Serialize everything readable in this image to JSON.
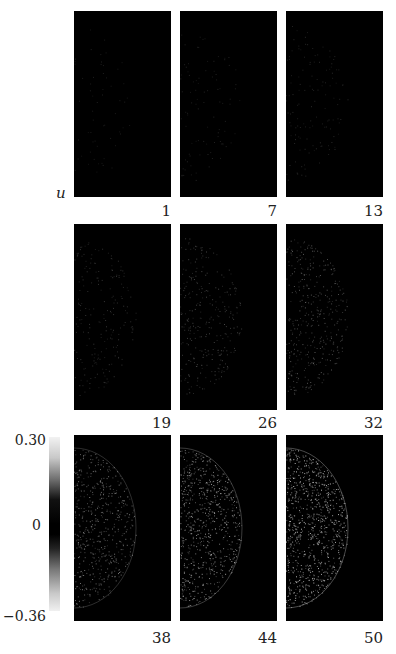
{
  "figure": {
    "row_label": "u",
    "frames": [
      {
        "label": "1",
        "intensity": 0.02
      },
      {
        "label": "7",
        "intensity": 0.06
      },
      {
        "label": "13",
        "intensity": 0.1
      },
      {
        "label": "19",
        "intensity": 0.18
      },
      {
        "label": "26",
        "intensity": 0.28
      },
      {
        "label": "32",
        "intensity": 0.38
      },
      {
        "label": "38",
        "intensity": 0.55
      },
      {
        "label": "44",
        "intensity": 0.72
      },
      {
        "label": "50",
        "intensity": 0.9
      }
    ],
    "colorbar": {
      "max_label": "0.30",
      "mid_label": "0",
      "min_label": "−0.36"
    }
  }
}
